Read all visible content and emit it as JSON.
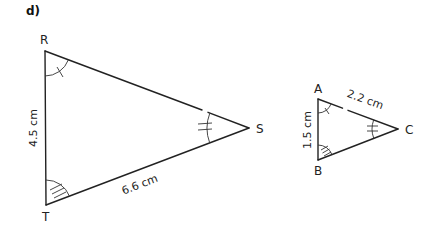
{
  "part_label": "d)",
  "triangles": [
    {
      "name": "RST",
      "vertices": [
        {
          "label": "R"
        },
        {
          "label": "S"
        },
        {
          "label": "T"
        }
      ],
      "sides": [
        {
          "between": "RT",
          "measure": "4.5 cm"
        },
        {
          "between": "TS",
          "measure": "6.6 cm"
        }
      ],
      "angle_marks": [
        {
          "vertex": "R",
          "ticks": 1
        },
        {
          "vertex": "S",
          "ticks": 2
        },
        {
          "vertex": "T",
          "ticks": 3
        }
      ]
    },
    {
      "name": "ABC",
      "vertices": [
        {
          "label": "A"
        },
        {
          "label": "B"
        },
        {
          "label": "C"
        }
      ],
      "sides": [
        {
          "between": "AB",
          "measure": "1.5 cm"
        },
        {
          "between": "AC",
          "measure": "2.2 cm"
        }
      ],
      "angle_marks": [
        {
          "vertex": "A",
          "ticks": 1
        },
        {
          "vertex": "C",
          "ticks": 2
        },
        {
          "vertex": "B",
          "ticks": 3
        }
      ]
    }
  ],
  "colors": {
    "line": "#222222",
    "text": "#222222",
    "background": "#ffffff"
  }
}
